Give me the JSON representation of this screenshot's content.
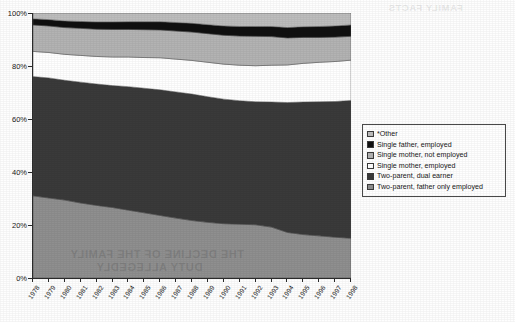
{
  "chart_data": {
    "type": "area",
    "stacked": true,
    "normalized": true,
    "title": "",
    "subtitle": "",
    "xlabel": "",
    "ylabel": "",
    "ylim": [
      0,
      100
    ],
    "ytick_labels": [
      "0%",
      "20%",
      "40%",
      "60%",
      "80%",
      "100%"
    ],
    "ytick_values": [
      0,
      20,
      40,
      60,
      80,
      100
    ],
    "grid": false,
    "legend_position": "right",
    "x": [
      1978,
      1979,
      1980,
      1981,
      1982,
      1983,
      1984,
      1985,
      1986,
      1987,
      1988,
      1989,
      1990,
      1991,
      1992,
      1993,
      1994,
      1995,
      1996,
      1997,
      1998
    ],
    "categories": [
      "1978",
      "1979",
      "1980",
      "1981",
      "1982",
      "1983",
      "1984",
      "1985",
      "1986",
      "1987",
      "1988",
      "1989",
      "1990",
      "1991",
      "1992",
      "1993",
      "1994",
      "1995",
      "1996",
      "1997",
      "1998"
    ],
    "series": [
      {
        "name": "Two-parent, father only employed",
        "color": "#8f8f8f",
        "values": [
          31.0,
          30.2,
          29.4,
          28.3,
          27.4,
          26.6,
          25.6,
          24.6,
          23.6,
          22.6,
          21.7,
          21.0,
          20.5,
          20.3,
          20.1,
          19.2,
          17.2,
          16.4,
          15.9,
          15.4,
          15.0
        ]
      },
      {
        "name": "Two-parent, dual earner",
        "color": "#3a3a3a",
        "values": [
          45.0,
          45.3,
          45.2,
          45.6,
          45.8,
          46.0,
          46.6,
          47.0,
          47.4,
          47.6,
          47.7,
          47.4,
          47.0,
          46.6,
          46.4,
          47.2,
          49.0,
          50.0,
          50.6,
          51.2,
          52.0
        ]
      },
      {
        "name": "Single mother, employed",
        "color": "#ffffff",
        "values": [
          9.5,
          9.6,
          9.8,
          10.1,
          10.4,
          10.8,
          11.2,
          11.6,
          12.1,
          12.4,
          12.7,
          13.0,
          13.2,
          13.4,
          13.6,
          13.9,
          14.2,
          14.6,
          14.9,
          15.1,
          15.2
        ]
      },
      {
        "name": "Single mother, not employed",
        "color": "#b3b3b3",
        "values": [
          10.0,
          10.0,
          10.1,
          10.2,
          10.3,
          10.4,
          10.4,
          10.5,
          10.5,
          10.6,
          10.7,
          10.8,
          10.9,
          11.0,
          11.1,
          10.8,
          10.2,
          9.8,
          9.4,
          9.2,
          9.0
        ]
      },
      {
        "name": "Single father, employed",
        "color": "#101010",
        "values": [
          2.3,
          2.4,
          2.5,
          2.6,
          2.7,
          2.8,
          2.9,
          3.0,
          3.1,
          3.2,
          3.3,
          3.4,
          3.5,
          3.6,
          3.7,
          3.8,
          3.9,
          4.0,
          4.1,
          4.2,
          4.3
        ]
      },
      {
        "name": "*Other",
        "color": "#bdbdbd",
        "values": [
          2.2,
          2.5,
          3.0,
          3.2,
          3.4,
          3.4,
          3.3,
          3.3,
          3.3,
          3.6,
          3.9,
          4.4,
          4.9,
          5.1,
          5.1,
          5.1,
          5.5,
          5.2,
          5.1,
          4.9,
          4.5
        ]
      }
    ]
  },
  "legend": {
    "items": [
      {
        "label": "*Other",
        "color": "#bdbdbd"
      },
      {
        "label": "Single father, employed",
        "color": "#101010"
      },
      {
        "label": "Single mother, not employed",
        "color": "#b3b3b3"
      },
      {
        "label": "Single mother, employed",
        "color": "#ffffff"
      },
      {
        "label": "Two-parent, dual earner",
        "color": "#3a3a3a"
      },
      {
        "label": "Two-parent, father only employed",
        "color": "#8f8f8f"
      }
    ]
  },
  "watermark": {
    "line1": "THE DECLINE OF THE FAMILY",
    "line2": "DUTY ALLEGEDLY",
    "top_right": "FAMILY FACTS"
  }
}
